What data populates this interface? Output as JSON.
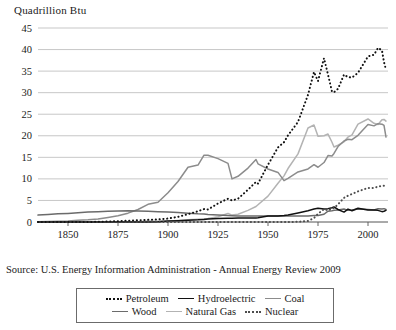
{
  "axis_title": "Quadrillion Btu",
  "source_note": "Source: U.S. Energy Information Administration - Annual Energy Review 2009",
  "colors": {
    "petroleum": "#111111",
    "hydroelectric": "#111111",
    "coal": "#8c8c8c",
    "wood": "#6b6b6b",
    "natural_gas": "#b3b3b3",
    "nuclear": "#4d4d4d",
    "grid": "#b9b9b9",
    "axis": "#555555",
    "text": "#1a1a1a"
  },
  "legend": {
    "rows": [
      [
        {
          "label": "Petroleum",
          "style": "dotted",
          "color": "#111111"
        },
        {
          "label": "Hydroelectric",
          "style": "solid",
          "color": "#111111"
        },
        {
          "label": "Coal",
          "style": "solid",
          "color": "#8c8c8c"
        }
      ],
      [
        {
          "label": "Wood",
          "style": "solid",
          "color": "#6b6b6b"
        },
        {
          "label": "Natural Gas",
          "style": "solid",
          "color": "#b3b3b3"
        },
        {
          "label": "Nuclear",
          "style": "dotted",
          "color": "#4d4d4d"
        }
      ]
    ]
  },
  "chart_data": {
    "type": "line",
    "title": "",
    "xlabel": "",
    "ylabel": "Quadrillion Btu",
    "xlim": [
      1835,
      2010
    ],
    "ylim": [
      0,
      45
    ],
    "yticks": [
      0,
      5,
      10,
      15,
      20,
      25,
      30,
      35,
      40,
      45
    ],
    "xticks": [
      1850,
      1875,
      1900,
      1925,
      1950,
      1975,
      2000
    ],
    "grid": true,
    "legend_position": "bottom",
    "x": [
      1835,
      1840,
      1845,
      1850,
      1855,
      1860,
      1865,
      1870,
      1875,
      1880,
      1885,
      1890,
      1895,
      1900,
      1905,
      1910,
      1915,
      1918,
      1920,
      1925,
      1930,
      1932,
      1935,
      1940,
      1944,
      1945,
      1950,
      1955,
      1958,
      1960,
      1965,
      1970,
      1973,
      1975,
      1978,
      1980,
      1982,
      1983,
      1985,
      1988,
      1990,
      1992,
      1995,
      2000,
      2003,
      2005,
      2007,
      2008,
      2009
    ],
    "series": [
      {
        "name": "Petroleum",
        "style": "dotted",
        "color": "#111111",
        "values": [
          0,
          0,
          0,
          0,
          0,
          0.01,
          0.05,
          0.1,
          0.2,
          0.3,
          0.4,
          0.5,
          0.6,
          0.8,
          1.2,
          1.8,
          2.5,
          3.0,
          2.9,
          4.3,
          5.4,
          5.0,
          5.4,
          7.5,
          9.3,
          8.9,
          13.3,
          17.3,
          18.5,
          20.1,
          23.2,
          29.5,
          34.8,
          32.7,
          38.0,
          34.2,
          30.2,
          30.1,
          30.9,
          34.2,
          33.6,
          33.5,
          34.6,
          38.4,
          38.8,
          40.4,
          39.8,
          37.1,
          35.3
        ]
      },
      {
        "name": "Coal",
        "style": "solid",
        "color": "#8c8c8c",
        "values": [
          0.08,
          0.1,
          0.15,
          0.22,
          0.4,
          0.52,
          0.7,
          1.05,
          1.45,
          2.05,
          2.9,
          4.1,
          4.6,
          6.8,
          9.4,
          12.7,
          13.2,
          15.5,
          15.5,
          14.7,
          13.6,
          10.0,
          10.6,
          12.5,
          14.5,
          13.5,
          12.3,
          11.5,
          9.6,
          10.1,
          11.6,
          12.3,
          13.3,
          12.7,
          13.8,
          15.4,
          15.3,
          15.9,
          17.5,
          18.8,
          19.2,
          19.1,
          20.1,
          22.6,
          22.3,
          22.8,
          22.7,
          22.4,
          19.7
        ]
      },
      {
        "name": "Natural Gas",
        "style": "solid",
        "color": "#b3b3b3",
        "values": [
          0,
          0,
          0,
          0,
          0,
          0,
          0,
          0,
          0.01,
          0.02,
          0.05,
          0.25,
          0.15,
          0.25,
          0.35,
          0.5,
          0.65,
          0.75,
          0.8,
          1.2,
          2.0,
          1.6,
          1.8,
          2.7,
          3.6,
          4.0,
          6.0,
          9.0,
          10.7,
          12.4,
          15.8,
          21.8,
          22.5,
          19.9,
          20.0,
          20.4,
          18.5,
          17.4,
          17.8,
          18.6,
          19.7,
          20.2,
          22.7,
          23.9,
          22.9,
          22.6,
          23.7,
          23.8,
          23.4
        ]
      },
      {
        "name": "Wood",
        "style": "solid",
        "color": "#6b6b6b",
        "values": [
          1.6,
          1.75,
          1.9,
          2.0,
          2.15,
          2.3,
          2.4,
          2.5,
          2.55,
          2.6,
          2.55,
          2.5,
          2.4,
          2.3,
          2.2,
          2.05,
          1.9,
          1.85,
          1.75,
          1.6,
          1.5,
          1.45,
          1.4,
          1.4,
          1.4,
          1.4,
          1.4,
          1.4,
          1.4,
          1.4,
          1.4,
          1.4,
          1.5,
          1.5,
          1.8,
          2.5,
          2.6,
          2.7,
          2.8,
          3.0,
          2.7,
          2.8,
          3.0,
          2.9,
          2.8,
          3.1,
          3.0,
          3.1,
          2.9
        ]
      },
      {
        "name": "Hydroelectric",
        "style": "solid",
        "color": "#111111",
        "values": [
          0,
          0,
          0,
          0,
          0,
          0,
          0,
          0,
          0,
          0,
          0,
          0.02,
          0.05,
          0.25,
          0.3,
          0.4,
          0.5,
          0.6,
          0.7,
          0.8,
          0.85,
          0.85,
          0.9,
          0.9,
          0.95,
          1.0,
          1.4,
          1.4,
          1.5,
          1.6,
          2.1,
          2.6,
          3.0,
          3.2,
          3.0,
          3.1,
          3.3,
          3.5,
          2.9,
          2.3,
          3.0,
          2.6,
          3.2,
          2.8,
          2.8,
          2.7,
          2.4,
          2.5,
          2.7
        ]
      },
      {
        "name": "Nuclear",
        "style": "dotted",
        "color": "#4d4d4d",
        "values": [
          0,
          0,
          0,
          0,
          0,
          0,
          0,
          0,
          0,
          0,
          0,
          0,
          0,
          0,
          0,
          0,
          0,
          0,
          0,
          0,
          0,
          0,
          0,
          0,
          0,
          0,
          0,
          0,
          0.01,
          0.01,
          0.04,
          0.24,
          0.91,
          1.9,
          3.0,
          2.7,
          3.1,
          3.2,
          4.1,
          5.6,
          6.1,
          6.5,
          7.1,
          7.9,
          7.9,
          8.2,
          8.4,
          8.4,
          8.4
        ]
      }
    ]
  }
}
